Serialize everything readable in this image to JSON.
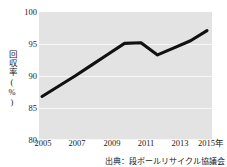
{
  "chart_data": {
    "type": "line",
    "title": "",
    "xlabel": "",
    "ylabel": "回収率(%)",
    "x": [
      2005,
      2006,
      2007,
      2008,
      2009,
      2010,
      2011,
      2012,
      2013,
      2014,
      2015
    ],
    "values": [
      86.8,
      88.4,
      90.0,
      91.7,
      93.4,
      95.1,
      95.2,
      93.3,
      94.4,
      95.5,
      97.1
    ],
    "series": [
      {
        "name": "回収率",
        "values": [
          86.8,
          88.4,
          90.0,
          91.7,
          93.4,
          95.1,
          95.2,
          93.3,
          94.4,
          95.5,
          97.1
        ]
      }
    ],
    "ylim": [
      80,
      100
    ],
    "xlim": [
      2005,
      2015
    ],
    "ytick_labels": [
      "100",
      "95",
      "90",
      "85",
      "80"
    ],
    "ytick_values": [
      100,
      95,
      90,
      85,
      80
    ],
    "xtick_labels": [
      "2005",
      "2007",
      "2009",
      "2011",
      "2013",
      "2015年"
    ],
    "xtick_values": [
      2005,
      2007,
      2009,
      2011,
      2013,
      2015
    ],
    "grid": true,
    "legend": "none",
    "line_color": "#111111",
    "plot_bg_color": "#e3e3e3",
    "grid_color": "#f7f7f7"
  },
  "axis": {
    "y_label_text": "回収率(%)",
    "y_ticks": [
      {
        "label": "100"
      },
      {
        "label": "95"
      },
      {
        "label": "90"
      },
      {
        "label": "85"
      },
      {
        "label": "80"
      }
    ],
    "x_ticks": [
      {
        "label": "2005"
      },
      {
        "label": "2007"
      },
      {
        "label": "2009"
      },
      {
        "label": "2011"
      },
      {
        "label": "2013"
      },
      {
        "label": "2015年"
      }
    ]
  },
  "footer": {
    "source": "出典：段ボールリサイクル協議会"
  }
}
